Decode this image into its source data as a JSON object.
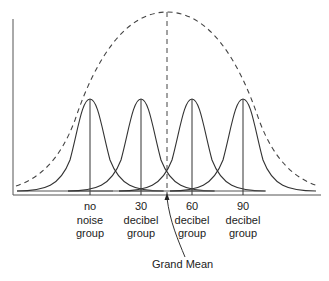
{
  "diagram": {
    "title": "",
    "grand_mean_label": "Grand Mean",
    "groups": [
      {
        "line1": "no",
        "line2": "noise",
        "line3": "group",
        "center_x": 90
      },
      {
        "line1": "30",
        "line2": "decibel",
        "line3": "group",
        "center_x": 141
      },
      {
        "line1": "60",
        "line2": "decibel",
        "line3": "group",
        "center_x": 192
      },
      {
        "line1": "90",
        "line2": "decibel",
        "line3": "group",
        "center_x": 243
      }
    ],
    "grand_mean_x": 167,
    "colors": {
      "line": "#444444",
      "background": "#ffffff"
    }
  }
}
